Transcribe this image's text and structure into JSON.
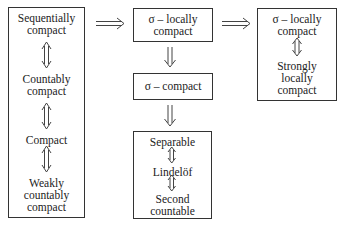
{
  "diagram": {
    "left_box": {
      "items": [
        "Sequentially\ncompact",
        "Countably\ncompact",
        "Compact",
        "Weakly\ncountably\ncompact"
      ]
    },
    "middle_top_box": {
      "label": "σ – locally\ncompact"
    },
    "middle_mid_box": {
      "label": "σ – compact"
    },
    "middle_bottom_box": {
      "items": [
        "Separable",
        "Lindelöf",
        "Second\ncountable"
      ]
    },
    "right_box": {
      "items": [
        "σ – locally\ncompact",
        "Strongly\nlocally\ncompact"
      ]
    },
    "arrows": {
      "left_to_middle": "implies",
      "middle_to_right": "implies",
      "top_to_sigma_compact": "implies",
      "sigma_compact_to_bottom": "implies",
      "equivalences": "iff"
    }
  }
}
